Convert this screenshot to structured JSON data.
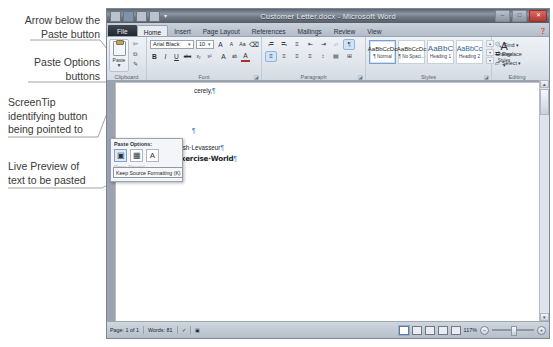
{
  "annotations": [
    {
      "id": "a1",
      "text": "Arrow below the\nPaste button"
    },
    {
      "id": "a2",
      "text": "Paste Options\nbuttons"
    },
    {
      "id": "a3",
      "text": "ScreenTip\nidentifying button\nbeing pointed to"
    },
    {
      "id": "a4",
      "text": "Live Preview of\ntext to be pasted"
    }
  ],
  "window": {
    "title": "Customer Letter.docx - Microsoft Word",
    "quick_access": {
      "save_icon": "save-icon",
      "undo_icon": "undo-icon",
      "redo_icon": "redo-icon",
      "customize_icon": "chevron-down-icon"
    },
    "controls": {
      "minimize": "–",
      "restore": "□",
      "close": "✕"
    },
    "help_icon": "help-icon"
  },
  "tabs": [
    {
      "label": "File",
      "state": "file"
    },
    {
      "label": "Home",
      "state": "active"
    },
    {
      "label": "Insert",
      "state": "normal"
    },
    {
      "label": "Page Layout",
      "state": "normal"
    },
    {
      "label": "References",
      "state": "normal"
    },
    {
      "label": "Mailings",
      "state": "normal"
    },
    {
      "label": "Review",
      "state": "normal"
    },
    {
      "label": "View",
      "state": "normal"
    }
  ],
  "ribbon": {
    "clipboard": {
      "group_label": "Clipboard",
      "paste_label": "Paste",
      "paste_arrow": "▼",
      "cut_icon": "scissors-icon",
      "copy_icon": "copy-icon",
      "format_painter_icon": "format-painter-icon"
    },
    "font": {
      "group_label": "Font",
      "font_name": "Arial Black",
      "font_size": "10",
      "grow_font": "A",
      "shrink_font": "A",
      "change_case": "Aa",
      "clear_formatting": "⌫",
      "bold": "B",
      "italic": "I",
      "underline": "U",
      "strikethrough": "abc",
      "subscript": "x₂",
      "superscript": "x²",
      "text_effects": "A",
      "highlight": "ab",
      "font_color": "A"
    },
    "paragraph": {
      "group_label": "Paragraph",
      "bullets": "≔",
      "numbering": "≕",
      "multilevel": "≡",
      "decrease_indent": "⇤",
      "increase_indent": "⇥",
      "sort": "↓↑",
      "show_marks": "¶",
      "align_left": "≡",
      "align_center": "≡",
      "align_right": "≡",
      "justify": "≡",
      "line_spacing": "↕",
      "shading": "▤",
      "borders": "⊞"
    },
    "styles": {
      "group_label": "Styles",
      "items": [
        {
          "sample": "AaBbCcDc",
          "name": "¶ Normal",
          "selected": true
        },
        {
          "sample": "AaBbCcDc",
          "name": "¶ No Spaci...",
          "selected": false
        },
        {
          "sample": "AaBbC",
          "name": "Heading 1",
          "selected": false
        },
        {
          "sample": "AaBbCc",
          "name": "Heading 2",
          "selected": false
        }
      ],
      "change_styles_label": "Change\nStyles ▾",
      "change_styles_icon": "change-styles-icon"
    },
    "editing": {
      "group_label": "Editing",
      "items": [
        {
          "label": "Find ▾",
          "icon": "find-icon"
        },
        {
          "label": "Replace",
          "icon": "replace-icon"
        },
        {
          "label": "Select ▾",
          "icon": "select-icon"
        }
      ]
    }
  },
  "paste_popup": {
    "title": "Paste Options:",
    "buttons": [
      {
        "icon": "keep-source-formatting-icon",
        "hover": true
      },
      {
        "icon": "merge-formatting-icon",
        "hover": false
      },
      {
        "icon": "keep-text-only-icon",
        "hover": false
      }
    ],
    "ghost_items": [
      "Paste Special...",
      "Set Default Paste..."
    ],
    "screentip": "Keep Source Formatting (K)"
  },
  "document": {
    "lines": [
      {
        "text": "cerely,",
        "mark": "¶",
        "style": "plain"
      },
      {
        "text": "",
        "mark": "¶",
        "style": "plain"
      },
      {
        "text": "Josh·Levasseur",
        "mark": "¶",
        "style": "plain"
      },
      {
        "text": "Exercise·World",
        "mark": "¶",
        "style": "preview"
      }
    ]
  },
  "status_bar": {
    "page": "Page: 1 of 1",
    "words": "Words: 81",
    "language_icon": "proofing-icon",
    "macro_icon": "macro-icon",
    "zoom": "117%",
    "zoom_out": "–",
    "zoom_in": "+",
    "views": [
      "print-layout-view",
      "full-screen-view",
      "web-layout-view",
      "outline-view",
      "draft-view"
    ]
  },
  "colors": {
    "chrome": "#d6dce5",
    "titlebar": "#6e7682",
    "accent": "#3b7fbd",
    "doc_background": "#9aa3ae"
  }
}
